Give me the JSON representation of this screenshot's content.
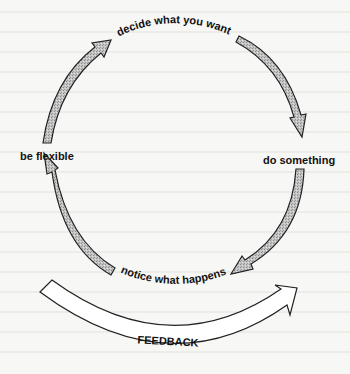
{
  "diagram": {
    "type": "cycle",
    "steps": [
      {
        "label": "decide what you want"
      },
      {
        "label": "do something"
      },
      {
        "label": "notice what happens"
      },
      {
        "label": "be flexible"
      }
    ],
    "feedback": {
      "label": "FEEDBACK"
    }
  },
  "colors": {
    "background": "#f7f7f5",
    "arrow_fill": "#bdbdbd",
    "outline": "#222222",
    "feedback_fill": "#ffffff"
  }
}
